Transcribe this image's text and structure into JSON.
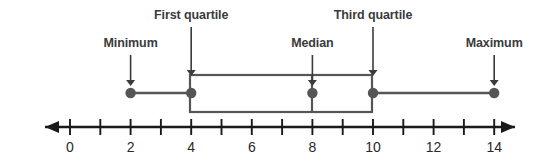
{
  "figure": {
    "type": "box-plot-diagram",
    "background_color": "#ffffff",
    "line_color": "#555555",
    "axis_color": "#1a1a1a",
    "label_color": "#3b3b3b",
    "tick_label_color": "#2a2a2a"
  },
  "axis": {
    "min": 0,
    "max": 14,
    "tick_step": 1,
    "labeled_step": 2,
    "tick_labels": [
      "0",
      "2",
      "4",
      "6",
      "8",
      "10",
      "12",
      "14"
    ],
    "tick_label_values": [
      0,
      2,
      4,
      6,
      8,
      10,
      12,
      14
    ],
    "left_arrow": true,
    "right_arrow": true
  },
  "callouts": [
    {
      "id": "minimum",
      "label": "Minimum",
      "value": 2,
      "label_row": "lower"
    },
    {
      "id": "first-quartile",
      "label": "First quartile",
      "value": 4,
      "label_row": "upper"
    },
    {
      "id": "median",
      "label": "Median",
      "value": 8,
      "label_row": "lower"
    },
    {
      "id": "third-quartile",
      "label": "Third quartile",
      "value": 10,
      "label_row": "upper"
    },
    {
      "id": "maximum",
      "label": "Maximum",
      "value": 14,
      "label_row": "lower"
    }
  ],
  "chart_data": {
    "type": "box",
    "title": "",
    "xlabel": "",
    "ylabel": "",
    "xlim": [
      0,
      14
    ],
    "grid": false,
    "legend": "none",
    "five_number_summary": {
      "minimum": 2,
      "first_quartile": 4,
      "median": 8,
      "third_quartile": 10,
      "maximum": 14
    },
    "marked_points": [
      2,
      4,
      8,
      10,
      14
    ],
    "box": {
      "left": 4,
      "right": 10,
      "median": 8
    },
    "whiskers": {
      "left": [
        2,
        4
      ],
      "right": [
        10,
        14
      ]
    },
    "annotations": [
      {
        "text": "Minimum",
        "points_to": 2
      },
      {
        "text": "First quartile",
        "points_to": 4
      },
      {
        "text": "Median",
        "points_to": 8
      },
      {
        "text": "Third quartile",
        "points_to": 10
      },
      {
        "text": "Maximum",
        "points_to": 14
      }
    ],
    "axis_ticks": [
      0,
      1,
      2,
      3,
      4,
      5,
      6,
      7,
      8,
      9,
      10,
      11,
      12,
      13,
      14
    ],
    "axis_tick_labels": [
      "0",
      "",
      "2",
      "",
      "4",
      "",
      "6",
      "",
      "8",
      "",
      "10",
      "",
      "12",
      "",
      "14"
    ]
  }
}
